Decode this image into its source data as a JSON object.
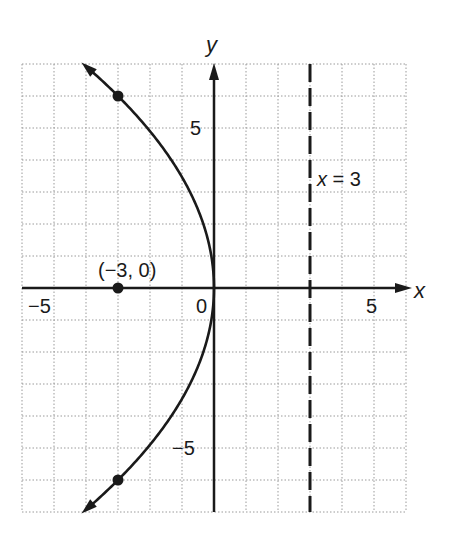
{
  "chart_data": {
    "type": "line",
    "title": "",
    "xlabel": "x",
    "ylabel": "y",
    "xlim": [
      -6,
      6
    ],
    "ylim": [
      -7,
      7
    ],
    "grid": true,
    "x_ticks_labeled": [
      -5,
      0,
      5
    ],
    "y_ticks_labeled": [
      5,
      -5
    ],
    "tick_labels": {
      "x_neg5": "−5",
      "origin": "0",
      "x_pos5": "5",
      "y_pos5": "5",
      "y_neg5": "−5"
    },
    "axis_labels": {
      "x": "x",
      "y": "y"
    },
    "series": [
      {
        "name": "parabola",
        "equation": "y^2 = -12x",
        "style": "solid",
        "arrows": "both-ends",
        "x": [
          -4.08,
          -3.0,
          -2.08,
          -1.33,
          -0.75,
          -0.33,
          -0.08,
          0,
          -0.08,
          -0.33,
          -0.75,
          -1.33,
          -2.08,
          -3.0,
          -4.08
        ],
        "y": [
          7,
          6,
          5,
          4,
          3,
          2,
          1,
          0,
          -1,
          -2,
          -3,
          -4,
          -5,
          -6,
          -7
        ]
      },
      {
        "name": "directrix",
        "equation": "x = 3",
        "style": "dashed",
        "x": [
          3,
          3
        ],
        "y": [
          -7,
          7
        ]
      }
    ],
    "points": [
      {
        "x": -3,
        "y": 6,
        "label": ""
      },
      {
        "x": -3,
        "y": 0,
        "label": "(−3, 0)"
      },
      {
        "x": -3,
        "y": -6,
        "label": ""
      }
    ],
    "annotations": [
      {
        "text": "x = 3",
        "x": 3.1,
        "y": 3.3
      },
      {
        "text": "(−3, 0)",
        "x": -3,
        "y": 0.5
      }
    ]
  },
  "labels": {
    "focus": "(−3, 0)",
    "directrix": "x = 3"
  }
}
